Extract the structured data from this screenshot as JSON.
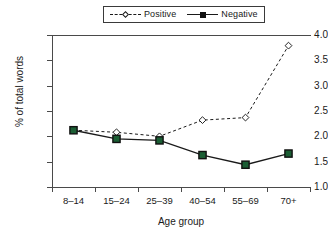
{
  "chart_data": {
    "type": "line",
    "title": "",
    "xlabel": "Age group",
    "ylabel": "% of total words",
    "categories": [
      "8–14",
      "15–24",
      "25–39",
      "40–54",
      "55–69",
      "70+"
    ],
    "ylim": [
      1.0,
      4.0
    ],
    "ytick_labels": [
      "4.0",
      "3.5",
      "3.0",
      "2.5",
      "2.0",
      "1.5",
      "1.0"
    ],
    "ytick_values": [
      4.0,
      3.5,
      3.0,
      2.5,
      2.0,
      1.5,
      1.0
    ],
    "grid": false,
    "legend_position": "top",
    "series": [
      {
        "name": "Positive",
        "values": [
          2.12,
          2.08,
          2.0,
          2.32,
          2.37,
          3.79
        ],
        "line_style": "dashed",
        "marker": "diamond-open",
        "color": "#1a1a1a",
        "marker_fill": "#ffffff"
      },
      {
        "name": "Negative",
        "values": [
          2.12,
          1.95,
          1.92,
          1.63,
          1.44,
          1.66
        ],
        "line_style": "solid",
        "marker": "square-filled",
        "color": "#1a1a1a",
        "marker_fill": "#1b5e34"
      }
    ]
  },
  "legend": {
    "entries": [
      {
        "label": "Positive"
      },
      {
        "label": "Negative"
      }
    ]
  }
}
